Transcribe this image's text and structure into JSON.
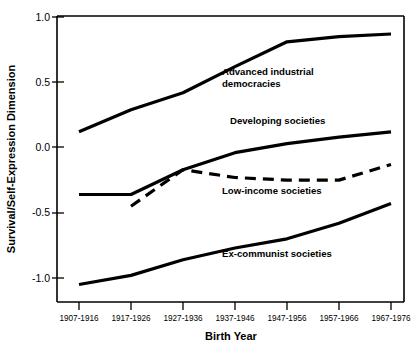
{
  "chart_data": {
    "type": "line",
    "title": "",
    "xlabel": "Birth Year",
    "ylabel": "Survival/Self-Expression Dimension",
    "categories": [
      "1907-1916",
      "1917-1926",
      "1927-1936",
      "1937-1946",
      "1947-1956",
      "1957-1966",
      "1967-1976"
    ],
    "ylim": [
      -1.25,
      1.0
    ],
    "xlim": [
      0,
      6
    ],
    "yticks": [
      1.0,
      0.5,
      0.0,
      -0.5,
      -1.0
    ],
    "ytick_labels": [
      "1.0",
      "0.5",
      "0.0",
      "-0.5",
      "-1.0"
    ],
    "grid": false,
    "legend_position": "inline-annotations",
    "series": [
      {
        "name": "Advanced industrial democracies",
        "style": "solid",
        "x": [
          "1907-1916",
          "1917-1926",
          "1927-1936",
          "1937-1946",
          "1947-1956",
          "1957-1966",
          "1967-1976"
        ],
        "values": [
          0.12,
          0.29,
          0.42,
          0.62,
          0.81,
          0.85,
          0.87
        ],
        "label_lines": [
          "Advanced industrial",
          "democracies"
        ]
      },
      {
        "name": "Developing societies",
        "style": "solid",
        "x": [
          "1907-1916",
          "1917-1926",
          "1927-1936",
          "1937-1946",
          "1947-1956",
          "1957-1966",
          "1967-1976"
        ],
        "values": [
          -0.36,
          -0.36,
          -0.17,
          -0.04,
          0.03,
          0.08,
          0.12
        ],
        "label_lines": [
          "Developing societies"
        ]
      },
      {
        "name": "Low-income societies",
        "style": "dashed",
        "x": [
          "1917-1926",
          "1927-1936",
          "1937-1946",
          "1947-1956",
          "1957-1966",
          "1967-1976"
        ],
        "values": [
          -0.45,
          -0.17,
          -0.23,
          -0.25,
          -0.25,
          -0.13
        ],
        "label_lines": [
          "Low-income societies"
        ]
      },
      {
        "name": "Ex-communist societies",
        "style": "solid",
        "x": [
          "1907-1916",
          "1917-1926",
          "1927-1936",
          "1937-1946",
          "1947-1956",
          "1957-1966",
          "1967-1976"
        ],
        "values": [
          -1.05,
          -0.98,
          -0.86,
          -0.77,
          -0.7,
          -0.58,
          -0.43
        ],
        "label_lines": [
          "Ex-communist societies"
        ]
      }
    ],
    "annotations": [
      {
        "text": "Advanced industrial",
        "series": "Advanced industrial democracies"
      },
      {
        "text": "democracies",
        "series": "Advanced industrial democracies"
      },
      {
        "text": "Developing societies",
        "series": "Developing societies"
      },
      {
        "text": "Low-income societies",
        "series": "Low-income societies"
      },
      {
        "text": "Ex-communist societies",
        "series": "Ex-communist societies"
      }
    ],
    "colors": {
      "line": "#000000",
      "axis": "#000000",
      "background": "#ffffff"
    }
  }
}
